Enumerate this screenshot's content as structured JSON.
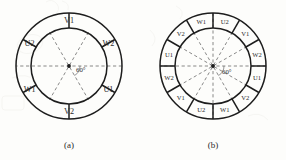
{
  "figure": {
    "background_color": "#fdfdfb",
    "line_color": "#1d1d1d",
    "dashed_color": "#6b6b6b",
    "text_color": "#2b2b2b"
  },
  "panels": [
    {
      "id": "a",
      "caption": "(a)",
      "center": {
        "x": 69,
        "y": 66
      },
      "outer_radius": 53,
      "inner_radius": 38,
      "sector_count": 6,
      "sector_angle_deg": 60,
      "divider_offset_deg": 30,
      "angle_annotation": "60°",
      "angle_annotation_pos": {
        "x": 76,
        "y": 72
      },
      "dashed_diameters_deg": [
        0,
        60,
        120
      ],
      "sector_labels": [
        {
          "label": "V1",
          "angle_deg": 90
        },
        {
          "label": "W2",
          "angle_deg": 30
        },
        {
          "label": "U1",
          "angle_deg": 330
        },
        {
          "label": "V2",
          "angle_deg": 270
        },
        {
          "label": "W1",
          "angle_deg": 210
        },
        {
          "label": "U2",
          "angle_deg": 150
        }
      ]
    },
    {
      "id": "b",
      "caption": "(b)",
      "center": {
        "x": 213,
        "y": 66
      },
      "outer_radius": 53,
      "inner_radius": 38,
      "sector_count": 12,
      "sector_angle_deg": 30,
      "divider_offset_deg": 0,
      "angle_annotation": "60°",
      "angle_annotation_pos": {
        "x": 222,
        "y": 74
      },
      "dashed_diameters_deg": [
        0,
        30,
        60,
        90,
        120,
        150
      ],
      "sector_labels": [
        {
          "label": "U2",
          "angle_deg": 75
        },
        {
          "label": "V1",
          "angle_deg": 45
        },
        {
          "label": "W2",
          "angle_deg": 15
        },
        {
          "label": "U1",
          "angle_deg": 345
        },
        {
          "label": "V2",
          "angle_deg": 315
        },
        {
          "label": "W1",
          "angle_deg": 285
        },
        {
          "label": "U2",
          "angle_deg": 255
        },
        {
          "label": "V1",
          "angle_deg": 225
        },
        {
          "label": "W2",
          "angle_deg": 195
        },
        {
          "label": "U1",
          "angle_deg": 165
        },
        {
          "label": "V2",
          "angle_deg": 135
        },
        {
          "label": "W1",
          "angle_deg": 105
        }
      ]
    }
  ]
}
